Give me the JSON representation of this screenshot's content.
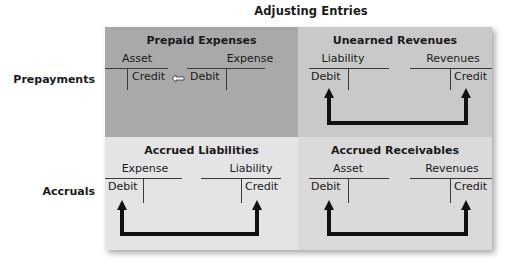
{
  "title": "Adjusting Entries",
  "row_labels": [
    "Prepayments",
    "Accruals"
  ],
  "colors": {
    "prepaid_expenses_bg": "#a9a9a9",
    "unearned_revenues_bg": "#c9c9c9",
    "accrued_liabilities_bg": "#e4e4e4",
    "accrued_receivables_bg": "#dadada",
    "line": "#3a3a3a",
    "arrow": "#111111"
  },
  "cells": {
    "prepaid_expenses": {
      "title": "Prepaid Expenses",
      "left_account": {
        "name": "Asset",
        "side_label": "Credit"
      },
      "right_account": {
        "name": "Expense",
        "side_label": "Debit"
      },
      "connector": "small-left-arrow"
    },
    "unearned_revenues": {
      "title": "Unearned Revenues",
      "left_account": {
        "name": "Liability",
        "side_label": "Debit"
      },
      "right_account": {
        "name": "Revenues",
        "side_label": "Credit"
      },
      "connector": "bracket-arrow"
    },
    "accrued_liabilities": {
      "title": "Accrued Liabilities",
      "left_account": {
        "name": "Expense",
        "side_label": "Debit"
      },
      "right_account": {
        "name": "Liability",
        "side_label": "Credit"
      },
      "connector": "bracket-arrow"
    },
    "accrued_receivables": {
      "title": "Accrued Receivables",
      "left_account": {
        "name": "Asset",
        "side_label": "Debit"
      },
      "right_account": {
        "name": "Revenues",
        "side_label": "Credit"
      },
      "connector": "bracket-arrow"
    }
  }
}
